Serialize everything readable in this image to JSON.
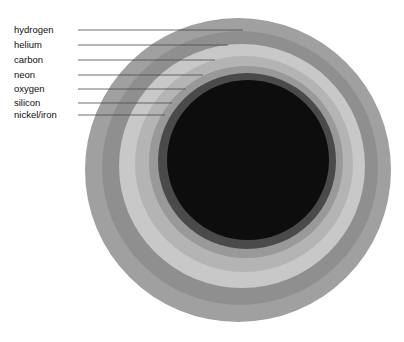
{
  "figure": {
    "background_color": "#ffffff",
    "width": 404,
    "height": 342
  },
  "chart_data": {
    "type": "pie",
    "xlabel": "",
    "ylabel": "",
    "layout": "concentric nested shells, labels left-aligned with horizontal leader lines",
    "legend_position": "left",
    "grid": false,
    "categories": [
      "hydrogen",
      "helium",
      "carbon",
      "neon",
      "oxygen",
      "silicon",
      "nickel/iron"
    ],
    "values": [
      1,
      1,
      1,
      1,
      1,
      1,
      1
    ],
    "series": [
      {
        "name": "shell radius (px)",
        "values": [
          152,
          137,
          122,
          108,
          96,
          88,
          80
        ]
      }
    ],
    "shells": [
      {
        "index": 0,
        "label": "hydrogen",
        "color": "#a0a0a0",
        "cx": 238,
        "cy": 170,
        "rx": 153,
        "ry": 152,
        "leader_y": 30,
        "leader_x_end": 243
      },
      {
        "index": 1,
        "label": "helium",
        "color": "#8f8f8f",
        "cx": 240,
        "cy": 168,
        "rx": 138,
        "ry": 137,
        "leader_y": 45,
        "leader_x_end": 228
      },
      {
        "index": 2,
        "label": "carbon",
        "color": "#c8c8c8",
        "cx": 242,
        "cy": 166,
        "rx": 123,
        "ry": 122,
        "leader_y": 60,
        "leader_x_end": 215
      },
      {
        "index": 3,
        "label": "neon",
        "color": "#b4b4b4",
        "cx": 244,
        "cy": 164,
        "rx": 109,
        "ry": 108,
        "leader_y": 75,
        "leader_x_end": 203
      },
      {
        "index": 4,
        "label": "oxygen",
        "color": "#999999",
        "cx": 246,
        "cy": 162,
        "rx": 97,
        "ry": 96,
        "leader_y": 89,
        "leader_x_end": 186
      },
      {
        "index": 5,
        "label": "silicon",
        "color": "#4a4a4a",
        "cx": 247,
        "cy": 161,
        "rx": 89,
        "ry": 88,
        "leader_y": 103,
        "leader_x_end": 172
      },
      {
        "index": 6,
        "label": "nickel/iron",
        "color": "#0d0d0d",
        "cx": 248,
        "cy": 160,
        "rx": 81,
        "ry": 80,
        "leader_y": 115,
        "leader_x_end": 165
      }
    ],
    "label_x": 14,
    "leader_x_start": 78,
    "colors": {
      "hydrogen": "#a0a0a0",
      "helium": "#8f8f8f",
      "carbon": "#c8c8c8",
      "neon": "#b4b4b4",
      "oxygen": "#999999",
      "silicon": "#4a4a4a",
      "nickel_iron": "#0d0d0d",
      "leader_line": "#4a4a4a",
      "label_text": "#111111",
      "background": "#ffffff"
    }
  }
}
